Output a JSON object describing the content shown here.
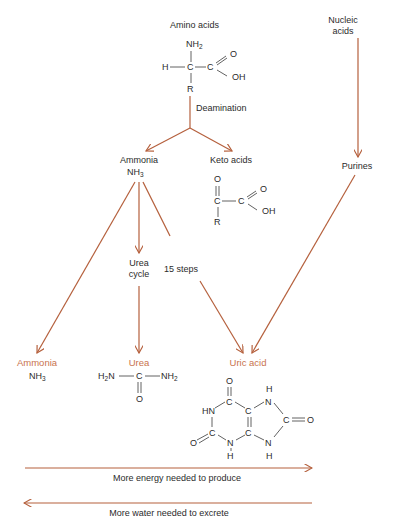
{
  "colors": {
    "arrow": "#b5603d",
    "accent_label": "#c8734e",
    "text": "#2b2b2b",
    "background": "#ffffff"
  },
  "nodes": {
    "amino_acids": {
      "label": "Amino acids",
      "formula": {
        "nh2": "NH",
        "nh2_sub": "2",
        "h": "H",
        "c1": "C",
        "c2": "C",
        "o": "O",
        "oh": "OH",
        "r": "R"
      }
    },
    "nucleic_acids": {
      "line1": "Nucleic",
      "line2": "acids"
    },
    "deamination": {
      "label": "Deamination"
    },
    "ammonia_mid": {
      "label": "Ammonia",
      "formula": "NH",
      "formula_sub": "3"
    },
    "keto_acids": {
      "label": "Keto acids",
      "formula": {
        "o_top": "O",
        "c1": "C",
        "c2": "C",
        "o": "O",
        "oh": "OH",
        "r": "R"
      }
    },
    "purines": {
      "label": "Purines"
    },
    "urea_cycle": {
      "line1": "Urea",
      "line2": "cycle"
    },
    "fifteen_steps": {
      "label": "15 steps"
    },
    "ammonia_end": {
      "label": "Ammonia",
      "formula": "NH",
      "formula_sub": "3"
    },
    "urea_end": {
      "label": "Urea",
      "formula": {
        "h2n_h": "H",
        "h2n_sub": "2",
        "h2n_n": "N",
        "c": "C",
        "nh2_n": "NH",
        "nh2_sub": "2",
        "o": "O"
      }
    },
    "uric_acid": {
      "label": "Uric acid",
      "formula": {
        "o_top": "O",
        "c_top": "C",
        "hn": "HN",
        "c_left": "C",
        "o_left": "O",
        "n_bottom": "N",
        "h_bottom1": "H",
        "c_mid1": "C",
        "c_mid2": "C",
        "n_top": "N",
        "h_top": "H",
        "c_right": "C",
        "o_right": "O",
        "n_bottom2": "N",
        "h_bottom2": "H"
      }
    }
  },
  "scales": {
    "energy": {
      "label": "More energy needed to produce",
      "direction": "right"
    },
    "water": {
      "label": "More water needed to excrete",
      "direction": "left"
    }
  }
}
